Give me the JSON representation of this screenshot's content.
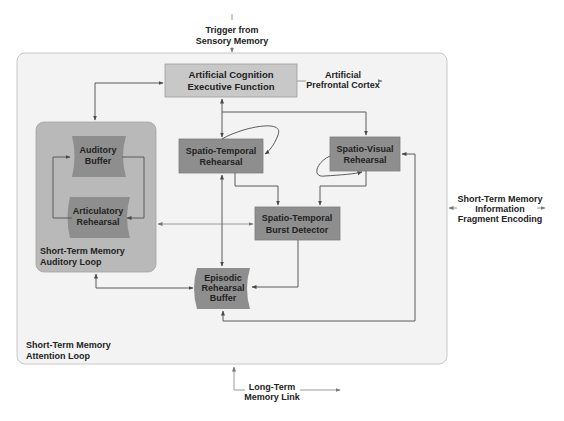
{
  "diagram": {
    "inputs": {
      "trigger": [
        "Trigger from",
        "Sensory Memory"
      ],
      "long_term": [
        "Long-Term",
        "Memory Link"
      ],
      "prefrontal": [
        "Artificial",
        "Prefrontal Cortex"
      ],
      "fragment_encoding": [
        "Short-Term Memory",
        "Information",
        "Fragment Encoding"
      ]
    },
    "outer_loop": {
      "label": [
        "Short-Term Memory",
        "Attention Loop"
      ],
      "fill": "#f3f3f3",
      "stroke": "#c8c8c8"
    },
    "executive": {
      "label": [
        "Artificial Cognition",
        "Executive Function"
      ],
      "fill": "#c8c8c8"
    },
    "auditory_loop": {
      "label": [
        "Short-Term Memory",
        "Auditory Loop"
      ],
      "fill": "#b9b9b9",
      "buffer": [
        "Auditory",
        "Buffer"
      ],
      "rehearsal": [
        "Articulatory",
        "Rehearsal"
      ],
      "node_fill": "#8e8e8e"
    },
    "spatio_temporal": {
      "label": [
        "Spatio-Temporal",
        "Rehearsal"
      ],
      "fill": "#8e8e8e"
    },
    "spatio_visual": {
      "label": [
        "Spatio-Visual",
        "Rehearsal"
      ],
      "fill": "#8e8e8e"
    },
    "burst_detector": {
      "label": [
        "Spatio-Temporal",
        "Burst Detector"
      ],
      "fill": "#8e8e8e"
    },
    "episodic": {
      "label": [
        "Episodic",
        "Rehearsal",
        "Buffer"
      ],
      "fill": "#8e8e8e"
    }
  }
}
